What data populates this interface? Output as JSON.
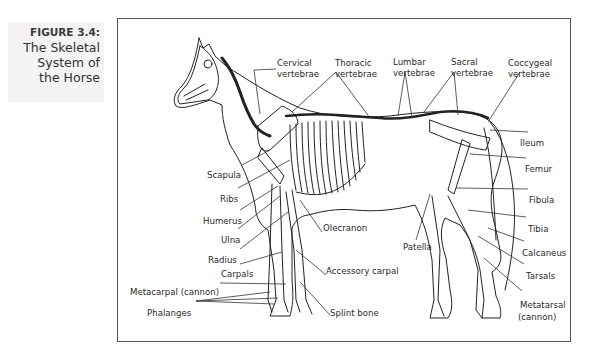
{
  "caption": {
    "figure_number": "FIGURE 3.4:",
    "title_lines": [
      "The Skeletal",
      "System of",
      "the Horse"
    ]
  },
  "labels": {
    "cervical": [
      "Cervical",
      "vertebrae"
    ],
    "thoracic": [
      "Thoracic",
      "vertebrae"
    ],
    "lumbar": [
      "Lumbar",
      "vertebrae"
    ],
    "sacral": [
      "Sacral",
      "vertebrae"
    ],
    "coccygeal": [
      "Coccygeal",
      "vertebrae"
    ],
    "ileum": "Ileum",
    "femur": "Femur",
    "fibula": "Fibula",
    "tibia": "Tibia",
    "calcaneus": "Calcaneus",
    "tarsals": "Tarsals",
    "metatarsal": [
      "Metatarsal",
      "(cannon)"
    ],
    "scapula": "Scapula",
    "ribs": "Ribs",
    "humerus": "Humerus",
    "ulna": "Ulna",
    "radius": "Radius",
    "carpals": "Carpals",
    "metacarpal": "Metacarpal (cannon)",
    "phalanges": "Phalanges",
    "olecranon": "Olecranon",
    "accessory_carpal": "Accessory carpal",
    "splint_bone": "Splint bone",
    "patella": "Patella"
  }
}
